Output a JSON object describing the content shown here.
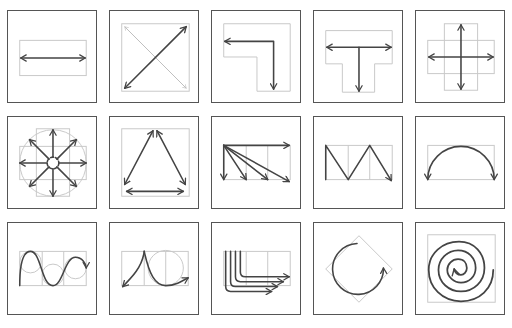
{
  "grid": {
    "columns": 5,
    "rows": 3
  },
  "colors": {
    "frame": "#555555",
    "arrow": "#444444",
    "guide": "#c8c8c8",
    "background": "#ffffff"
  },
  "tiles": [
    {
      "row": 1,
      "col": 1,
      "icon": "horizontal-double-arrow"
    },
    {
      "row": 1,
      "col": 2,
      "icon": "diagonal-double-arrow"
    },
    {
      "row": 1,
      "col": 3,
      "icon": "l-shape-bent-arrow"
    },
    {
      "row": 1,
      "col": 4,
      "icon": "t-shape-arrow"
    },
    {
      "row": 1,
      "col": 5,
      "icon": "cross-four-way-arrow"
    },
    {
      "row": 2,
      "col": 1,
      "icon": "radial-eight-way-arrow"
    },
    {
      "row": 2,
      "col": 2,
      "icon": "triangle-cycle-arrow"
    },
    {
      "row": 2,
      "col": 3,
      "icon": "fan-out-arrows"
    },
    {
      "row": 2,
      "col": 4,
      "icon": "zigzag-arrow"
    },
    {
      "row": 2,
      "col": 5,
      "icon": "semicircle-arc-arrow"
    },
    {
      "row": 3,
      "col": 1,
      "icon": "wave-curve-arrow"
    },
    {
      "row": 3,
      "col": 2,
      "icon": "peak-curve-arrow"
    },
    {
      "row": 3,
      "col": 3,
      "icon": "stacked-bent-arrows"
    },
    {
      "row": 3,
      "col": 4,
      "icon": "circular-arrow"
    },
    {
      "row": 3,
      "col": 5,
      "icon": "spiral-arrow"
    }
  ]
}
